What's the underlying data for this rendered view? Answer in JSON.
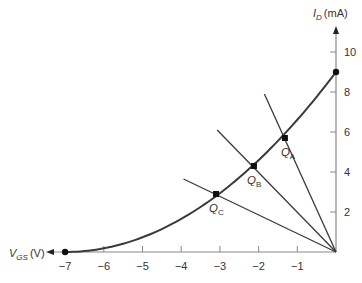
{
  "chart_data": {
    "type": "line",
    "title": "",
    "xlabel": "V_GS (V)",
    "ylabel": "I_D (mA)",
    "xlabel_main": "V",
    "xlabel_sub": "GS",
    "xlabel_unit": "(V)",
    "ylabel_main": "I",
    "ylabel_sub": "D",
    "ylabel_unit": "(mA)",
    "xlim": [
      -7,
      0
    ],
    "ylim": [
      0,
      11
    ],
    "x_ticks": [
      -7,
      -6,
      -5,
      -4,
      -3,
      -2,
      -1
    ],
    "x_tick_labels": [
      "−7",
      "−6",
      "−5",
      "−4",
      "−3",
      "−2",
      "−1"
    ],
    "y_ticks": [
      2,
      4,
      6,
      8,
      10
    ],
    "y_tick_labels": [
      "2",
      "4",
      "6",
      "8",
      "10"
    ],
    "grid": false,
    "legend": null,
    "series": [
      {
        "name": "Transfer characteristic",
        "kind": "curve",
        "x": [
          -7,
          -6,
          -5,
          -4,
          -3,
          -2,
          -1,
          0
        ],
        "y": [
          0,
          0.18,
          0.73,
          1.65,
          2.94,
          4.59,
          6.61,
          9
        ],
        "endpoint_markers": [
          [
            -7,
            0
          ],
          [
            0,
            9
          ]
        ]
      },
      {
        "name": "Bias line A",
        "kind": "line",
        "x": [
          0,
          -1.85
        ],
        "y": [
          0,
          7.9
        ]
      },
      {
        "name": "Bias line B",
        "kind": "line",
        "x": [
          0,
          -3.07
        ],
        "y": [
          0,
          6.1
        ]
      },
      {
        "name": "Bias line C",
        "kind": "line",
        "x": [
          0,
          -3.94
        ],
        "y": [
          0,
          3.65
        ]
      }
    ],
    "annotations": [
      {
        "label": "Q",
        "sub": "A",
        "x": -1.32,
        "y": 5.7
      },
      {
        "label": "Q",
        "sub": "B",
        "x": -2.12,
        "y": 4.3
      },
      {
        "label": "Q",
        "sub": "C",
        "x": -3.1,
        "y": 2.9
      }
    ],
    "colors": {
      "curve": "#3a3a3a",
      "bias_lines": "#3a3a3a",
      "axes": "#888888",
      "text": "#333333",
      "markers": "#111111"
    }
  }
}
